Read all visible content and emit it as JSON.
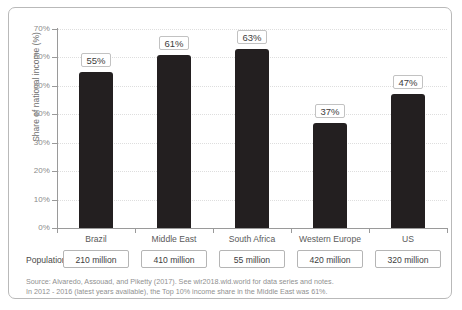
{
  "chart_data": {
    "type": "bar",
    "title": "",
    "xlabel": "",
    "ylabel": "Share of national income (%)",
    "ylim": [
      0,
      70
    ],
    "grid": true,
    "legend": "none",
    "categories": [
      "Brazil",
      "Middle East",
      "South Africa",
      "Western Europe",
      "US"
    ],
    "values": [
      55,
      61,
      63,
      37,
      47
    ],
    "value_labels": [
      "55%",
      "61%",
      "63%",
      "37%",
      "47%"
    ],
    "ytick_labels": [
      "0%",
      "10%",
      "20%",
      "30%",
      "40%",
      "50%",
      "60%",
      "70%"
    ],
    "ytick_values": [
      0,
      10,
      20,
      30,
      40,
      50,
      60,
      70
    ],
    "bar_color": "#231f20",
    "annotations": {
      "population_row_label": "Population",
      "population_values": [
        "210 million",
        "410 million",
        "55 million",
        "420 million",
        "320 million"
      ]
    }
  },
  "note": {
    "line1": "Source: Alvaredo, Assouad, and Piketty (2017). See wir2018.wid.world for data series and notes.",
    "line2": "In 2012 - 2016 (latest years available), the Top 10% income share in the Middle East was 61%."
  }
}
